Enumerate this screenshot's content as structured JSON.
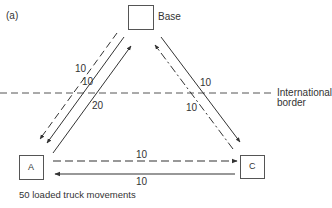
{
  "figure": {
    "panel_label": "(a)",
    "caption": "50 loaded truck movements",
    "border_label_line1": "International",
    "border_label_line2": "border",
    "nodes": {
      "base": "Base",
      "a": "A",
      "c": "C"
    },
    "flows": {
      "base_to_a_dashed": "10",
      "base_to_a_solid": "10",
      "a_to_base_solid": "20",
      "c_to_base_dashdot": "10",
      "base_to_c_solid": "10",
      "a_to_c_dashed": "10",
      "c_to_a_solid": "10"
    },
    "colors": {
      "line": "#333333",
      "border_line": "#555555"
    }
  }
}
